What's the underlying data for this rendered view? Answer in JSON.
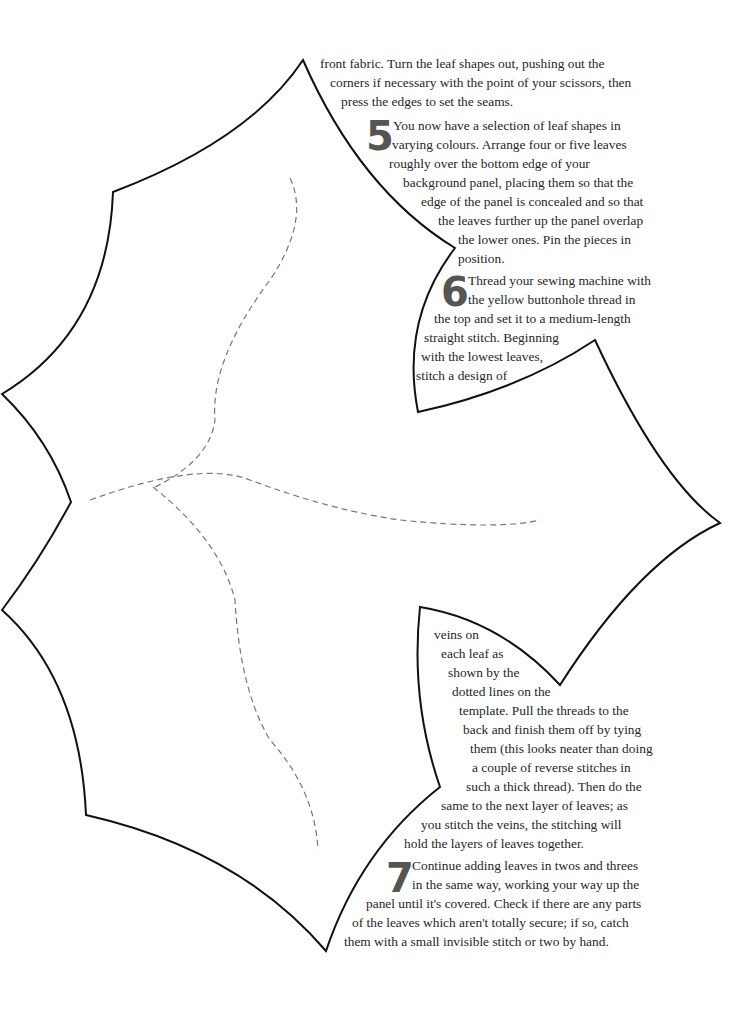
{
  "document": {
    "type": "craft-instructions-with-leaf-template",
    "colors": {
      "outline": "#111111",
      "vein_dash": "#777777",
      "step_number": "#555555",
      "text": "#262626"
    },
    "intro_continuation": [
      "front fabric. Turn the leaf shapes out, pushing out the",
      "corners if necessary with the point of your scissors, then",
      "press the edges to set the seams."
    ],
    "steps": [
      {
        "number": "5",
        "lines": [
          "You now have a selection of leaf shapes in",
          "varying colours. Arrange four or five leaves",
          "roughly over the bottom edge of your",
          "background panel, placing them so that the",
          "edge of the panel is concealed and so that",
          "the leaves further up the panel overlap",
          "the lower ones. Pin the pieces in",
          "position."
        ]
      },
      {
        "number": "6",
        "lines": [
          "Thread your sewing machine with",
          "the yellow buttonhole thread in",
          "the top and set it to a medium-length",
          "straight stitch. Beginning",
          "with the lowest leaves,",
          "stitch a design of",
          "veins on",
          "each leaf as",
          "shown by the",
          "dotted lines on the",
          "template. Pull the threads to the",
          "back and finish them off by tying",
          "them (this looks neater than doing",
          "a couple of reverse stitches in",
          "such a thick thread). Then do the",
          "same to the next layer of leaves; as",
          "you stitch the veins, the stitching will",
          "hold the layers of leaves together."
        ]
      },
      {
        "number": "7",
        "lines": [
          "Continue adding leaves in twos and threes",
          "in the same way, working your way up the",
          "panel until it's covered. Check if there are any parts",
          "of the leaves which aren't totally secure; if so, catch",
          "them with a small invisible stitch or two by hand."
        ]
      }
    ],
    "template": {
      "shape": "holly-leaf-outline",
      "veins": "dashed-lines"
    }
  }
}
